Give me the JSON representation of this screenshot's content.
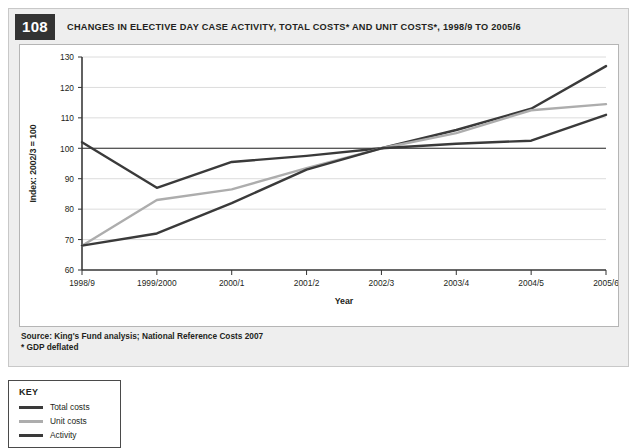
{
  "figure": {
    "number": "108",
    "title": "CHANGES IN ELECTIVE DAY CASE ACTIVITY, TOTAL COSTS* AND UNIT COSTS*, 1998/9 TO 2005/6",
    "source_line1": "Source: King's Fund analysis; National Reference Costs 2007",
    "source_line2": "* GDP deflated"
  },
  "key": {
    "title": "KEY",
    "items": [
      {
        "label": "Total costs",
        "color": "#3a3a3a"
      },
      {
        "label": "Unit costs",
        "color": "#adadad"
      },
      {
        "label": "Activity",
        "color": "#3a3a3a"
      }
    ]
  },
  "chart_data": {
    "type": "line",
    "title": "CHANGES IN ELECTIVE DAY CASE ACTIVITY, TOTAL COSTS* AND UNIT COSTS*, 1998/9 TO 2005/6",
    "xlabel": "Year",
    "ylabel": "Index: 2002/3 = 100",
    "categories": [
      "1998/9",
      "1999/2000",
      "2000/1",
      "2001/2",
      "2002/3",
      "2003/4",
      "2004/5",
      "2005/6"
    ],
    "yticks": [
      60,
      70,
      80,
      90,
      100,
      110,
      120,
      130
    ],
    "ylim": [
      60,
      130
    ],
    "grid": true,
    "reference_line": 100,
    "legend_position": "below-left",
    "series": [
      {
        "name": "Total costs",
        "color": "#3a3a3a",
        "values": [
          102,
          87,
          95.5,
          97.5,
          100,
          106,
          113,
          127
        ]
      },
      {
        "name": "Unit costs",
        "color": "#adadad",
        "values": [
          68,
          83,
          86.5,
          93.5,
          100,
          105,
          112.5,
          114.5
        ]
      },
      {
        "name": "Activity",
        "color": "#3a3a3a",
        "values": [
          68,
          72,
          82,
          93,
          100,
          101.5,
          102.5,
          111
        ]
      }
    ]
  }
}
